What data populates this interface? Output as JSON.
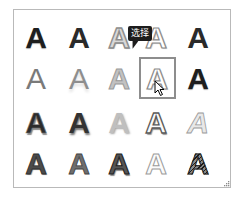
{
  "gallery": {
    "name": "WordArt style gallery",
    "columns": 5,
    "rows": 4,
    "items": [
      {
        "label": "A",
        "style": "solid-black"
      },
      {
        "label": "A",
        "style": "solid-dark"
      },
      {
        "label": "A",
        "style": "gray-outline"
      },
      {
        "label": "A",
        "style": "white-outline"
      },
      {
        "label": "A",
        "style": "solid-dark"
      },
      {
        "label": "A",
        "style": "thin-gray"
      },
      {
        "label": "A",
        "style": "thin-reflect"
      },
      {
        "label": "A",
        "style": "gradient-gray"
      },
      {
        "label": "A",
        "style": "white-outline"
      },
      {
        "label": "A",
        "style": "solid-black"
      },
      {
        "label": "A",
        "style": "bevel-dark"
      },
      {
        "label": "A",
        "style": "shadow-dark"
      },
      {
        "label": "A",
        "style": "soft-gray"
      },
      {
        "label": "A",
        "style": "inset-white"
      },
      {
        "label": "A",
        "style": "light-italic"
      },
      {
        "label": "A",
        "style": "heavy-gray"
      },
      {
        "label": "A",
        "style": "mid-gray"
      },
      {
        "label": "A",
        "style": "dark-bevel"
      },
      {
        "label": "A",
        "style": "ghost-outline"
      },
      {
        "label": "A",
        "style": "hatched"
      }
    ],
    "selected_index": 8
  },
  "tooltip": {
    "text": "选择"
  },
  "colors": {
    "border": "#b9b9b9",
    "selection_border": "#8d8d8d",
    "tooltip_bg": "#1d1d1d",
    "tooltip_text": "#ffffff"
  }
}
